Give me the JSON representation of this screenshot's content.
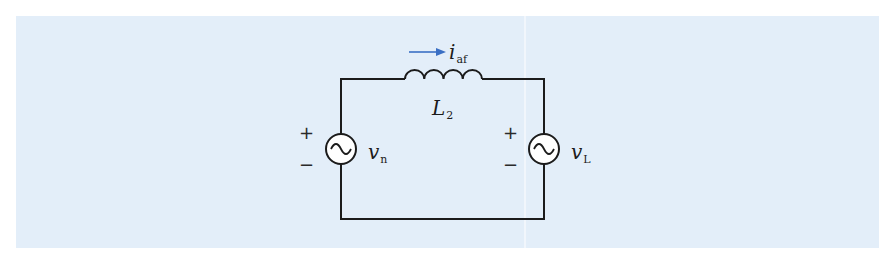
{
  "figure": {
    "background_color": "#e3eef9",
    "wire_color": "#1b1b1b",
    "arrow_color": "#3a6fc4"
  },
  "components": {
    "inductor": {
      "label": "L",
      "subscript": "2"
    },
    "current": {
      "label": "i",
      "subscript": "af",
      "direction": "right"
    },
    "source_left": {
      "label": "v",
      "subscript": "n",
      "type": "ac-voltage-source",
      "plus": "+",
      "minus": "−"
    },
    "source_right": {
      "label": "v",
      "subscript": "L",
      "type": "ac-voltage-source",
      "plus": "+",
      "minus": "−"
    }
  }
}
